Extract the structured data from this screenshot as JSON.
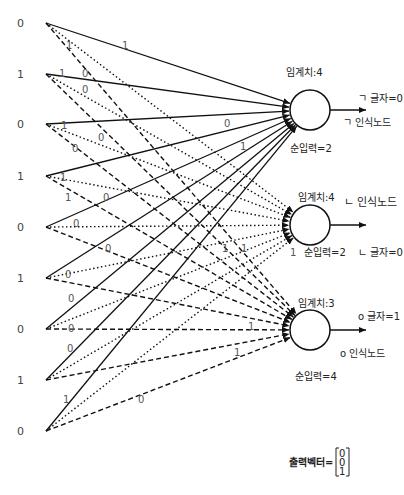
{
  "inputs": [
    "0",
    "1",
    "0",
    "1",
    "0",
    "1",
    "0",
    "1",
    "0"
  ],
  "weights": {
    "node1": [
      "1",
      "1",
      "0",
      "1",
      "0",
      "1",
      "0",
      "1",
      "0"
    ],
    "node2": [
      "1",
      "0",
      "0",
      "1",
      "0",
      "1",
      "1",
      "1",
      "0"
    ],
    "node3": [
      "0",
      "1",
      "1",
      "0",
      "0",
      "0",
      "1",
      "1",
      "0"
    ]
  },
  "weight_labels_shown": [
    {
      "text": "1",
      "edge": "node1-0"
    },
    {
      "text": "1",
      "edge": "node2-0"
    },
    {
      "text": "1",
      "edge": "node1-1"
    },
    {
      "text": "0",
      "edge": "node3-1"
    },
    {
      "text": "0",
      "edge": "node2-1"
    },
    {
      "text": "1",
      "edge": "node1-2"
    },
    {
      "text": "0",
      "edge": "node2-2"
    },
    {
      "text": "0",
      "edge": "node3-2"
    },
    {
      "text": "1",
      "edge": "node2-3"
    },
    {
      "text": "1",
      "edge": "node3-3"
    },
    {
      "text": "0",
      "edge": "node1-3"
    },
    {
      "text": "0",
      "edge": "node2-4"
    },
    {
      "text": "0",
      "edge": "node3-4"
    },
    {
      "text": "0",
      "edge": "node2-5"
    },
    {
      "text": "0",
      "edge": "node3-5"
    },
    {
      "text": "0",
      "edge": "node2-6"
    },
    {
      "text": "0",
      "edge": "node3-6"
    },
    {
      "text": "1",
      "edge": "node1-8"
    },
    {
      "text": "0",
      "edge": "node3-8"
    },
    {
      "text": "0",
      "edge": "node1-mid"
    },
    {
      "text": "1",
      "edge": "node1-mid2"
    },
    {
      "text": "1",
      "edge": "node2-a"
    },
    {
      "text": "1",
      "edge": "node2-b"
    },
    {
      "text": "1",
      "edge": "node2-c"
    },
    {
      "text": "1",
      "edge": "node3-a"
    },
    {
      "text": "1",
      "edge": "node3-b"
    }
  ],
  "nodes": [
    {
      "threshold": "임계치:4",
      "net_input": "순입력=2",
      "output": "ㄱ 글자=0",
      "name": "ㄱ 인식노드",
      "style": "solid"
    },
    {
      "threshold": "임계치:4",
      "net_input": "순입력=2",
      "output": "ㄴ 글자=0",
      "name": "ㄴ 인식노드",
      "style": "dotted"
    },
    {
      "threshold": "임계치:3",
      "net_input": "순입력=4",
      "output": "o 글자=1",
      "name": "o 인식노드",
      "style": "dashed"
    }
  ],
  "output_vector": {
    "label": "출력벡터=",
    "values": [
      "0",
      "0",
      "1"
    ]
  }
}
